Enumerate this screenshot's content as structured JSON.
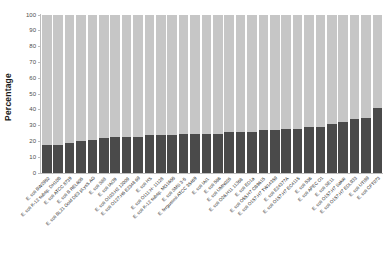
{
  "chart_data": {
    "type": "bar",
    "stacked": true,
    "title": "",
    "xlabel": "",
    "ylabel": "Percentage",
    "ylim": [
      0,
      100
    ],
    "yticks": [
      0,
      10,
      20,
      30,
      40,
      50,
      60,
      70,
      80,
      90,
      100
    ],
    "ytick_labels": [
      "0",
      "10",
      "20",
      "30",
      "40",
      "50",
      "60",
      "70",
      "80",
      "90",
      "100"
    ],
    "grid": false,
    "legend": "none",
    "colors": {
      "series_lower": "#4a4a4a",
      "series_upper": "#c6c6c6",
      "axis": "#bdbdbd",
      "text": "#262626"
    },
    "categories": [
      "E. coli BW2952",
      "E. coli K-12 subsp. DH10B",
      "E. coli ATCC 8739",
      "E. coli B REL606",
      "E. coli BL21 Gold DE3 pLysS AG",
      "E. coli S88",
      "E. coli IAI39",
      "E. coli O103:H2 12009",
      "E. coli O127:H6 E2348 69",
      "E. coli HS",
      "E. coli O111:H- 11128",
      "E. coli K-12 subsp. MG1655",
      "E. coli SMS 3-5",
      "E. fergusonii ATCC 35469",
      "E. coli IAI1",
      "E. coli 586",
      "E. coli UMN026",
      "E. coli O26:H11 11368",
      "E. coli ED1a",
      "E. coli O55:H7 CB9615",
      "E. coli O157:H7 TW14359",
      "E. coli E24377A",
      "E. coli O157:H7 EC4115",
      "E. coli 536",
      "E. coli APEC O1",
      "E. coli SE11",
      "E. coli O157:H7 Sakai",
      "E. coli O157:H7 EDL933",
      "E. coli UTI89",
      "E. coli CFT073"
    ],
    "series": [
      {
        "name": "lower",
        "color": "#4a4a4a",
        "values": [
          18,
          18,
          19,
          20,
          21,
          22,
          23,
          23,
          23,
          24,
          24,
          24,
          25,
          25,
          25,
          25,
          26,
          26,
          26,
          27,
          27,
          28,
          28,
          29,
          29,
          31,
          32,
          34,
          35,
          41
        ]
      },
      {
        "name": "upper",
        "color": "#c6c6c6",
        "values": [
          82,
          82,
          81,
          80,
          79,
          78,
          77,
          77,
          77,
          76,
          76,
          76,
          75,
          75,
          75,
          75,
          74,
          74,
          74,
          73,
          73,
          72,
          72,
          71,
          71,
          69,
          68,
          66,
          65,
          59
        ]
      }
    ]
  }
}
